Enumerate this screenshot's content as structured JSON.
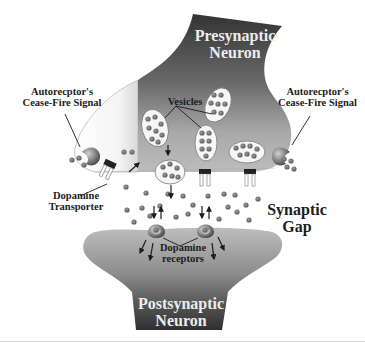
{
  "diagram": {
    "labels": {
      "presynaptic": [
        "Presynaptic",
        "Neuron"
      ],
      "postsynaptic": [
        "Postsynaptic",
        "Neuron"
      ],
      "autoreceptor_left": [
        "Autorecptor's",
        "Cease-Fire Signal"
      ],
      "autoreceptor_right": [
        "Autorecptor's",
        "Cease-Fire Signal"
      ],
      "vesicles": "Vesicles",
      "transporter": [
        "Dopamine",
        "Transporter"
      ],
      "gap": [
        "Synaptic",
        "Gap"
      ],
      "receptors": [
        "Dopamine",
        "receptors"
      ]
    },
    "colors": {
      "neuron_dark": "#3a3a3a",
      "neuron_mid": "#8a8a8a",
      "neuron_light": "#bdbdbd",
      "dopamine_dot": "#7a7a7a",
      "background": "#ffffff"
    }
  }
}
